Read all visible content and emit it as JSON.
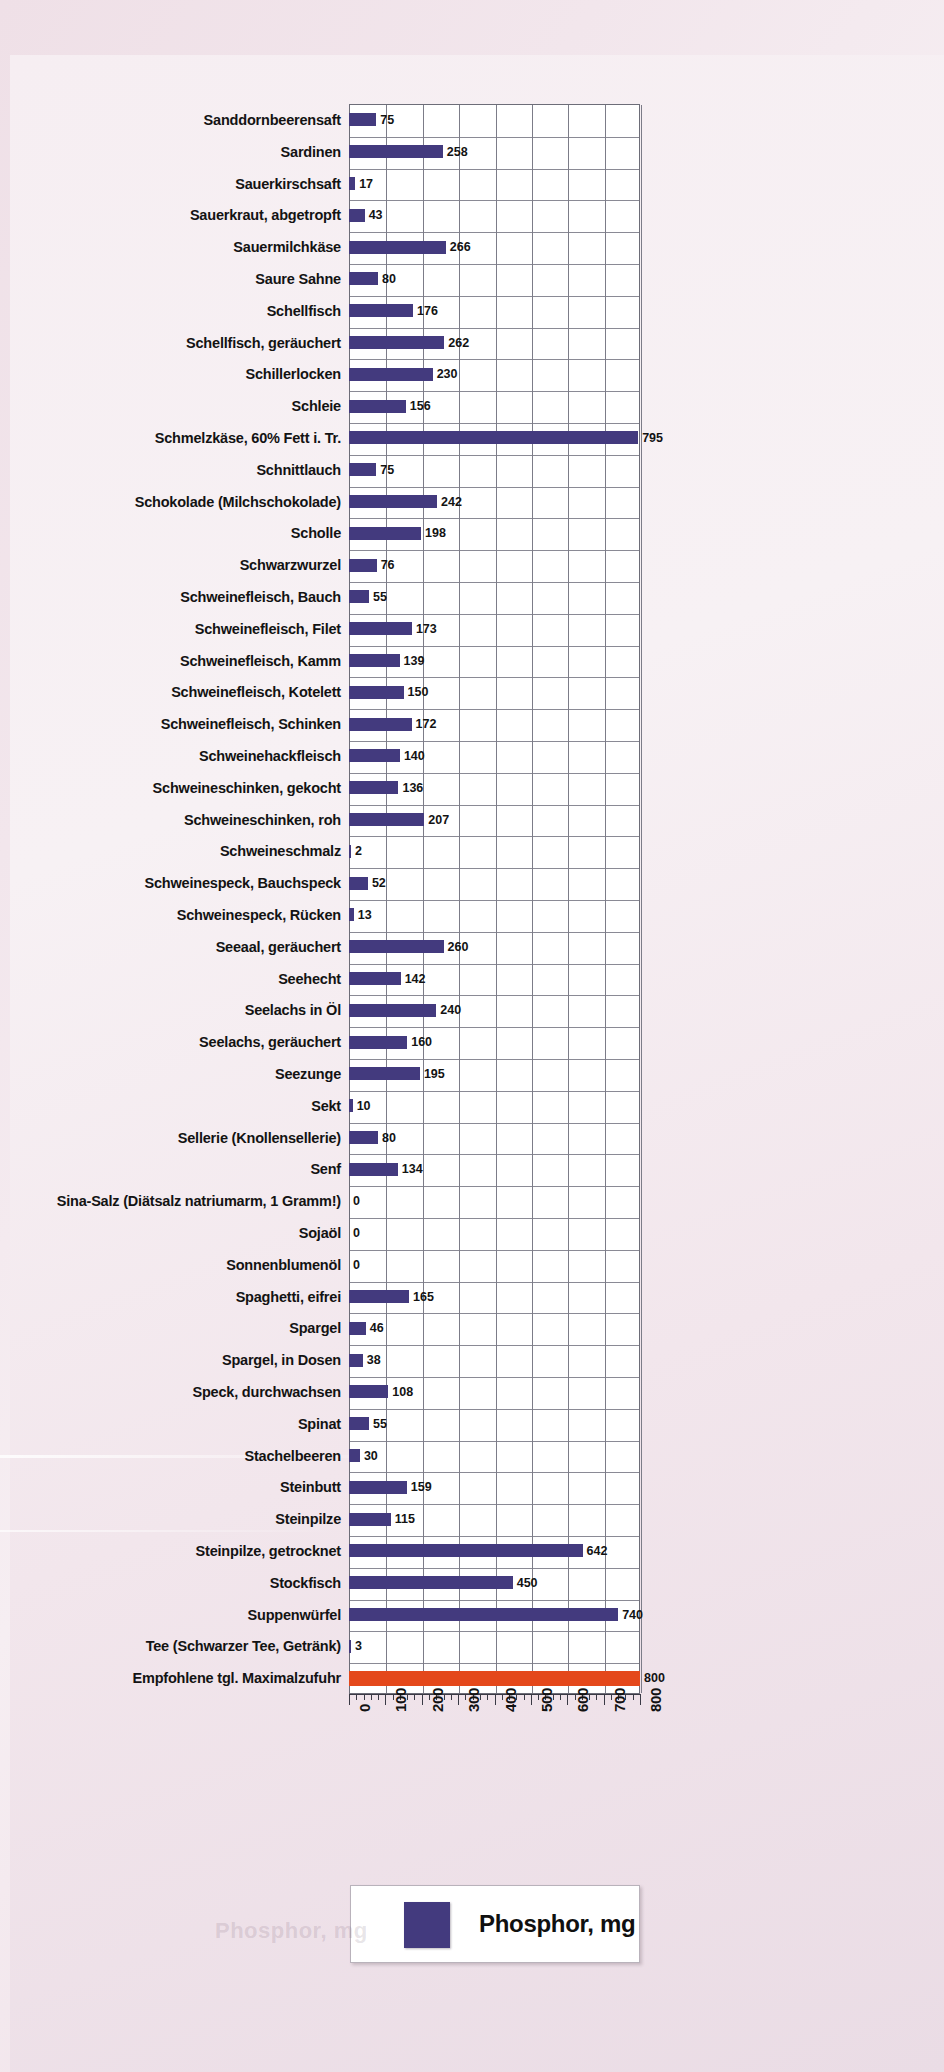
{
  "legend": {
    "label": "Phosphor, mg",
    "swatch_color": "#433a7e"
  },
  "colors": {
    "bar": "#433a7e",
    "reference_bar": "#e4481b",
    "plot_background": "#ffffff",
    "page_background": "#f2e6ec",
    "grid": "#7c7c88"
  },
  "chart_data": {
    "type": "bar",
    "orientation": "horizontal",
    "title": "",
    "subtitle": "",
    "xlabel": "",
    "ylabel": "",
    "xlim": [
      0,
      800
    ],
    "xticks": [
      0,
      100,
      200,
      300,
      400,
      500,
      600,
      700,
      800
    ],
    "xticklabels": [
      "0",
      "100",
      "200",
      "300",
      "400",
      "500",
      "600",
      "700",
      "800"
    ],
    "minor_ticks_per_major": 5,
    "grid": true,
    "legend": [
      "Phosphor, mg"
    ],
    "legend_position": "bottom",
    "unit": "mg",
    "categories": [
      "Sanddornbeerensaft",
      "Sardinen",
      "Sauerkirschsaft",
      "Sauerkraut, abgetropft",
      "Sauermilchkäse",
      "Saure Sahne",
      "Schellfisch",
      "Schellfisch, geräuchert",
      "Schillerlocken",
      "Schleie",
      "Schmelzkäse, 60% Fett i. Tr.",
      "Schnittlauch",
      "Schokolade (Milchschokolade)",
      "Scholle",
      "Schwarzwurzel",
      "Schweinefleisch, Bauch",
      "Schweinefleisch, Filet",
      "Schweinefleisch, Kamm",
      "Schweinefleisch, Kotelett",
      "Schweinefleisch, Schinken",
      "Schweinehackfleisch",
      "Schweineschinken, gekocht",
      "Schweineschinken, roh",
      "Schweineschmalz",
      "Schweinespeck, Bauchspeck",
      "Schweinespeck, Rücken",
      "Seeaal, geräuchert",
      "Seehecht",
      "Seelachs in  Öl",
      "Seelachs, geräuchert",
      "Seezunge",
      "Sekt",
      "Sellerie (Knollensellerie)",
      "Senf",
      "Sina-Salz (Diätsalz natriumarm, 1 Gramm!)",
      "Sojaöl",
      "Sonnenblumenöl",
      "Spaghetti, eifrei",
      "Spargel",
      "Spargel, in Dosen",
      "Speck, durchwachsen",
      "Spinat",
      "Stachelbeeren",
      "Steinbutt",
      "Steinpilze",
      "Steinpilze, getrocknet",
      "Stockfisch",
      "Suppenwürfel",
      "Tee (Schwarzer Tee, Getränk)",
      "Empfohlene tgl. Maximalzufuhr"
    ],
    "values": [
      75,
      258,
      17,
      43,
      266,
      80,
      176,
      262,
      230,
      156,
      795,
      75,
      242,
      198,
      76,
      55,
      173,
      139,
      150,
      172,
      140,
      136,
      207,
      2,
      52,
      13,
      260,
      142,
      240,
      160,
      195,
      10,
      80,
      134,
      0,
      0,
      0,
      165,
      46,
      38,
      108,
      55,
      30,
      159,
      115,
      642,
      450,
      740,
      3,
      800
    ],
    "reference_index": 49,
    "reference_label": "Empfohlene tgl. Maximalzufuhr",
    "reference_value": 800
  }
}
